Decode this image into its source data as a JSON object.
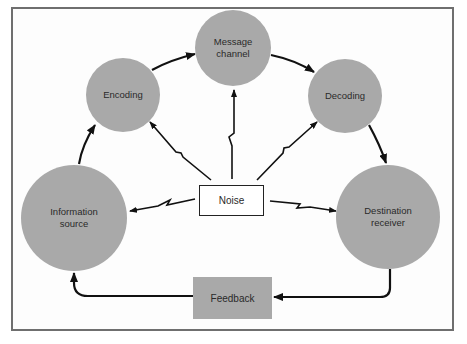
{
  "diagram": {
    "type": "communication-process",
    "nodes": {
      "information_source": {
        "label": "Information source",
        "line1": "Information",
        "line2": "source"
      },
      "encoding": {
        "label": "Encoding"
      },
      "message_channel": {
        "label": "Message channel",
        "line1": "Message",
        "line2": "channel"
      },
      "decoding": {
        "label": "Decoding"
      },
      "destination_receiver": {
        "label": "Destination receiver",
        "line1": "Destination",
        "line2": "receiver"
      },
      "noise": {
        "label": "Noise"
      },
      "feedback": {
        "label": "Feedback"
      }
    },
    "edges": [
      {
        "from": "Information source",
        "to": "Encoding",
        "style": "curved-arrow"
      },
      {
        "from": "Encoding",
        "to": "Message channel",
        "style": "curved-arrow"
      },
      {
        "from": "Message channel",
        "to": "Decoding",
        "style": "curved-arrow"
      },
      {
        "from": "Decoding",
        "to": "Destination receiver",
        "style": "curved-arrow"
      },
      {
        "from": "Destination receiver",
        "to": "Feedback",
        "style": "elbow-arrow"
      },
      {
        "from": "Feedback",
        "to": "Information source",
        "style": "elbow-arrow"
      },
      {
        "from": "Noise",
        "to": "Information source",
        "style": "lightning-arrow"
      },
      {
        "from": "Noise",
        "to": "Encoding",
        "style": "lightning-arrow"
      },
      {
        "from": "Noise",
        "to": "Message channel",
        "style": "lightning-arrow"
      },
      {
        "from": "Noise",
        "to": "Decoding",
        "style": "lightning-arrow"
      },
      {
        "from": "Noise",
        "to": "Destination receiver",
        "style": "lightning-arrow"
      }
    ],
    "colors": {
      "node_fill": "#a9a9a9",
      "arrow": "#111111",
      "frame": "#6f6f6f",
      "background": "#ffffff"
    }
  }
}
